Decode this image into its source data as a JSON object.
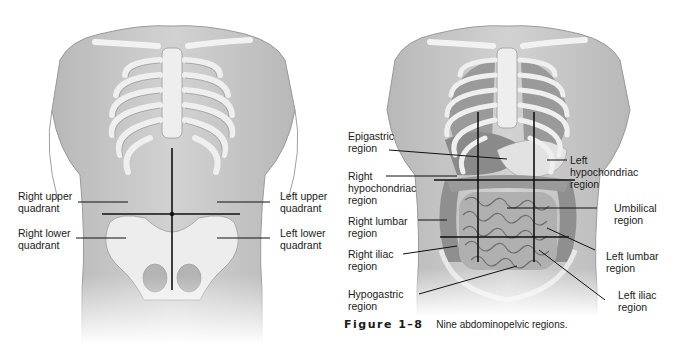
{
  "left_figure": {
    "title": "Four abdominopelvic quadrants",
    "labels": {
      "right_upper": [
        "Right upper",
        "quadrant"
      ],
      "right_lower": [
        "Right lower",
        "quadrant"
      ],
      "left_upper": [
        "Left upper",
        "quadrant"
      ],
      "left_lower": [
        "Left lower",
        "quadrant"
      ]
    }
  },
  "right_figure": {
    "labels": {
      "epigastric": [
        "Epigastric",
        "region"
      ],
      "right_hypochondriac": [
        "Right",
        "hypochondriac",
        "region"
      ],
      "right_lumbar": [
        "Right lumbar",
        "region"
      ],
      "right_iliac": [
        "Right iliac",
        "region"
      ],
      "hypogastric": [
        "Hypogastric",
        "region"
      ],
      "left_hypochondriac": [
        "Left",
        "hypochondriac",
        "region"
      ],
      "umbilical": [
        "Umbilical",
        "region"
      ],
      "left_lumbar": [
        "Left lumbar",
        "region"
      ],
      "left_iliac": [
        "Left iliac",
        "region"
      ]
    }
  },
  "caption": {
    "figure_number": "Figure 1–8",
    "text": "Nine abdominopelvic regions."
  },
  "colors": {
    "skin": "#c9c9c9",
    "skin_dark": "#a9a9a9",
    "bone": "#ececec",
    "organ": "#8f8f8f",
    "line": "#111111"
  }
}
